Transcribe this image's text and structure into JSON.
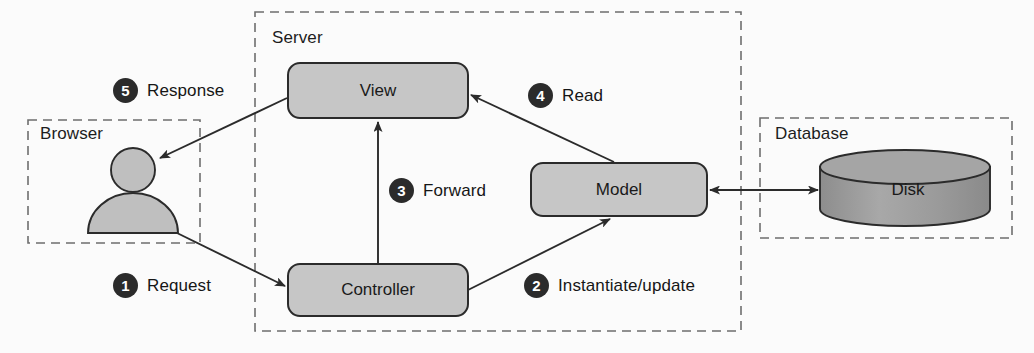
{
  "diagram": {
    "groups": [
      {
        "id": "browser",
        "label": "Browser",
        "x": 28,
        "y": 120,
        "w": 172,
        "h": 123
      },
      {
        "id": "server",
        "label": "Server",
        "x": 255,
        "y": 12,
        "w": 486,
        "h": 319
      },
      {
        "id": "database",
        "label": "Database",
        "x": 760,
        "y": 118,
        "w": 252,
        "h": 120
      }
    ],
    "nodes": [
      {
        "id": "view",
        "label": "View",
        "shape": "rounded-rect",
        "x": 288,
        "y": 63,
        "w": 180,
        "h": 55
      },
      {
        "id": "controller",
        "label": "Controller",
        "shape": "rounded-rect",
        "x": 288,
        "y": 264,
        "w": 180,
        "h": 52
      },
      {
        "id": "model",
        "label": "Model",
        "shape": "rounded-rect",
        "x": 531,
        "y": 163,
        "w": 176,
        "h": 53
      },
      {
        "id": "disk",
        "label": "Disk",
        "shape": "cylinder",
        "x": 820,
        "y": 152,
        "w": 170,
        "h": 72
      },
      {
        "id": "user",
        "label": "",
        "shape": "person",
        "x": 86,
        "y": 148,
        "w": 96,
        "h": 85
      }
    ],
    "steps": [
      {
        "number": "5",
        "label": "Response",
        "x": 113,
        "y": 78,
        "from": "view",
        "to": "user"
      },
      {
        "number": "1",
        "label": "Request",
        "x": 113,
        "y": 273,
        "from": "user",
        "to": "controller"
      },
      {
        "number": "3",
        "label": "Forward",
        "x": 389,
        "y": 178,
        "from": "controller",
        "to": "view"
      },
      {
        "number": "2",
        "label": "Instantiate/update",
        "x": 524,
        "y": 273,
        "from": "controller",
        "to": "model"
      },
      {
        "number": "4",
        "label": "Read",
        "x": 528,
        "y": 83,
        "from": "model",
        "to": "view"
      }
    ],
    "connections": [
      {
        "id": "model-disk",
        "from": "model",
        "to": "disk",
        "bidirectional": true,
        "label": ""
      }
    ],
    "colors": {
      "node_fill": "#c6c6c6",
      "node_stroke": "#2b2b2b",
      "disk_fill": "#9d9d9d",
      "group_stroke": "#6e6e6e",
      "badge_fill": "#2b2b2b",
      "badge_text": "#ffffff",
      "text": "#1a1a1a",
      "background": "#fbfbfb"
    }
  }
}
